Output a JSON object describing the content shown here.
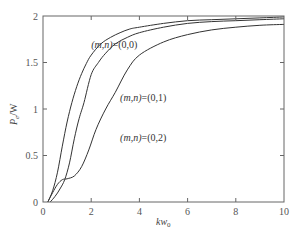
{
  "chart_data": {
    "type": "line",
    "title": "",
    "xlabel": "kw0",
    "xlabel_main": "kw",
    "xlabel_sub": "0",
    "ylabel": "Pe/W",
    "ylabel_main": "P",
    "ylabel_sub": "e",
    "ylabel_suffix": "/W",
    "xlim": [
      0,
      10
    ],
    "ylim": [
      0,
      2
    ],
    "xticks": [
      0,
      2,
      4,
      6,
      8,
      10
    ],
    "xtick_labels": [
      "0",
      "2",
      "4",
      "6",
      "8",
      "10"
    ],
    "yticks": [
      0,
      0.5,
      1,
      1.5,
      2
    ],
    "ytick_labels": [
      "0",
      "0.5",
      "1",
      "1.5",
      "2"
    ],
    "grid": false,
    "legend": "inline annotations",
    "series": [
      {
        "name": "(m,n)=(0,0)",
        "label_prefix": "(m,n)",
        "label_value": "=(0,0)",
        "label_pos": [
          2.0,
          1.66
        ],
        "x": [
          0.2,
          0.4,
          0.6,
          0.8,
          1.0,
          1.2,
          1.4,
          1.6,
          1.8,
          2.0,
          2.4,
          2.8,
          3.2,
          3.6,
          4.0,
          5.0,
          6.0,
          7.0,
          8.0,
          9.0,
          10.0
        ],
        "y": [
          0.0,
          0.12,
          0.32,
          0.6,
          0.86,
          1.07,
          1.24,
          1.38,
          1.49,
          1.58,
          1.7,
          1.77,
          1.82,
          1.86,
          1.88,
          1.92,
          1.95,
          1.96,
          1.97,
          1.98,
          1.99
        ]
      },
      {
        "name": "(m,n)=(0,1)",
        "label_prefix": "(m,n)",
        "label_value": "=(0,1)",
        "label_pos": [
          3.2,
          1.09
        ],
        "x": [
          0.3,
          0.5,
          0.7,
          0.9,
          1.1,
          1.3,
          1.5,
          1.7,
          2.0,
          2.3,
          2.6,
          3.0,
          3.5,
          4.0,
          5.0,
          6.0,
          7.0,
          8.0,
          9.0,
          10.0
        ],
        "y": [
          0.0,
          0.06,
          0.14,
          0.24,
          0.42,
          0.68,
          0.9,
          1.07,
          1.37,
          1.5,
          1.6,
          1.7,
          1.77,
          1.82,
          1.88,
          1.92,
          1.94,
          1.95,
          1.96,
          1.97
        ]
      },
      {
        "name": "(m,n)=(0,2)",
        "label_prefix": "(m,n)",
        "label_value": "=(0,2)",
        "label_pos": [
          3.2,
          0.66
        ],
        "x": [
          0.2,
          0.4,
          0.6,
          0.8,
          1.0,
          1.3,
          1.6,
          1.9,
          2.2,
          2.6,
          3.0,
          3.5,
          4.0,
          5.0,
          6.0,
          7.0,
          8.0,
          9.0,
          10.0
        ],
        "y": [
          0.0,
          0.1,
          0.19,
          0.24,
          0.25,
          0.28,
          0.38,
          0.56,
          0.78,
          1.0,
          1.18,
          1.42,
          1.58,
          1.72,
          1.8,
          1.85,
          1.88,
          1.9,
          1.91
        ]
      }
    ]
  },
  "style": {
    "axis_color": "#666666",
    "curve_color": "#333333",
    "background": "#ffffff"
  }
}
